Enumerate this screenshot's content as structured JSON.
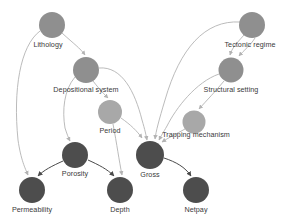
{
  "diagram": {
    "type": "directed-acyclic-graph",
    "canvas": {
      "width": 292,
      "height": 224,
      "background": "#ffffff"
    },
    "palette": {
      "node_medium": "#8f8f8f",
      "node_light": "#a8a8a8",
      "node_dark": "#4d4d4d",
      "edge_light": "#b3b3b3",
      "edge_dark": "#4a4a4a",
      "label_text": "#3a3a3a"
    },
    "nodes": [
      {
        "id": "lithology",
        "label": "Lithology",
        "cx": 52,
        "cy": 25,
        "r": 13,
        "fill": "#8f8f8f",
        "label_x": 48,
        "label_y": 40
      },
      {
        "id": "tectonic_regime",
        "label": "Tectonic regime",
        "cx": 252,
        "cy": 25,
        "r": 13,
        "fill": "#8f8f8f",
        "label_x": 250,
        "label_y": 40
      },
      {
        "id": "depositional_system",
        "label": "Depositional system",
        "cx": 86,
        "cy": 70,
        "r": 13,
        "fill": "#8f8f8f",
        "label_x": 86,
        "label_y": 85
      },
      {
        "id": "structural_setting",
        "label": "Structural setting",
        "cx": 231,
        "cy": 70,
        "r": 12.5,
        "fill": "#8f8f8f",
        "label_x": 231,
        "label_y": 85
      },
      {
        "id": "period",
        "label": "Period",
        "cx": 110,
        "cy": 112,
        "r": 12,
        "fill": "#a8a8a8",
        "label_x": 110,
        "label_y": 126
      },
      {
        "id": "trapping_mechanism",
        "label": "Trapping mechanism",
        "cx": 194,
        "cy": 122,
        "r": 11.5,
        "fill": "#a8a8a8",
        "label_x": 196,
        "label_y": 130
      },
      {
        "id": "porosity",
        "label": "Porosity",
        "cx": 75,
        "cy": 155,
        "r": 13,
        "fill": "#4d4d4d",
        "label_x": 75,
        "label_y": 169
      },
      {
        "id": "gross",
        "label": "Gross",
        "cx": 150,
        "cy": 155,
        "r": 14,
        "fill": "#4d4d4d",
        "label_x": 150,
        "label_y": 170
      },
      {
        "id": "permeability",
        "label": "Permeability",
        "cx": 32,
        "cy": 190,
        "r": 13,
        "fill": "#4d4d4d",
        "label_x": 32,
        "label_y": 205
      },
      {
        "id": "depth",
        "label": "Depth",
        "cx": 120,
        "cy": 190,
        "r": 13,
        "fill": "#4d4d4d",
        "label_x": 120,
        "label_y": 205
      },
      {
        "id": "netpay",
        "label": "Netpay",
        "cx": 196,
        "cy": 190,
        "r": 13,
        "fill": "#4d4d4d",
        "label_x": 196,
        "label_y": 205
      }
    ],
    "edges": [
      {
        "from": "lithology",
        "to": "depositional_system",
        "style": "light"
      },
      {
        "from": "lithology",
        "to": "permeability",
        "style": "light"
      },
      {
        "from": "tectonic_regime",
        "to": "structural_setting",
        "style": "light"
      },
      {
        "from": "tectonic_regime",
        "to": "structural_setting",
        "style": "light"
      },
      {
        "from": "tectonic_regime",
        "to": "gross",
        "style": "light"
      },
      {
        "from": "depositional_system",
        "to": "period",
        "style": "light"
      },
      {
        "from": "depositional_system",
        "to": "gross",
        "style": "light"
      },
      {
        "from": "depositional_system",
        "to": "porosity",
        "style": "light"
      },
      {
        "from": "structural_setting",
        "to": "trapping_mechanism",
        "style": "light"
      },
      {
        "from": "structural_setting",
        "to": "gross",
        "style": "light"
      },
      {
        "from": "period",
        "to": "gross",
        "style": "light"
      },
      {
        "from": "period",
        "to": "depth",
        "style": "light"
      },
      {
        "from": "trapping_mechanism",
        "to": "gross",
        "style": "light"
      },
      {
        "from": "porosity",
        "to": "permeability",
        "style": "dark"
      },
      {
        "from": "porosity",
        "to": "depth",
        "style": "dark"
      },
      {
        "from": "gross",
        "to": "netpay",
        "style": "dark"
      }
    ]
  }
}
